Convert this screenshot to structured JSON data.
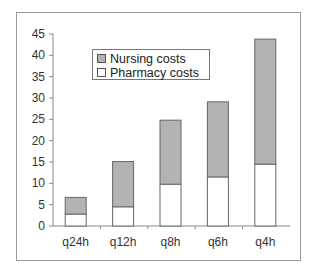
{
  "chart_data": {
    "type": "bar",
    "stacked": true,
    "title": "",
    "xlabel": "",
    "ylabel": "",
    "categories": [
      "q24h",
      "q12h",
      "q8h",
      "q6h",
      "q4h"
    ],
    "series": [
      {
        "name": "Pharmacy costs",
        "color": "#ffffff",
        "values": [
          2.8,
          4.5,
          9.8,
          11.5,
          14.5
        ]
      },
      {
        "name": "Nursing costs",
        "color": "#b3b3b3",
        "values": [
          3.9,
          10.6,
          15.0,
          17.6,
          29.3
        ]
      }
    ],
    "totals": [
      6.7,
      15.1,
      24.8,
      29.1,
      43.8
    ],
    "ylim": [
      0,
      45
    ],
    "yticks": [
      0,
      5,
      10,
      15,
      20,
      25,
      30,
      35,
      40,
      45
    ],
    "grid": false,
    "legend_position": "upper-left inside plot"
  },
  "legend": {
    "items": [
      {
        "label": "Nursing costs",
        "color": "#b3b3b3"
      },
      {
        "label": "Pharmacy costs",
        "color": "#ffffff"
      }
    ]
  }
}
